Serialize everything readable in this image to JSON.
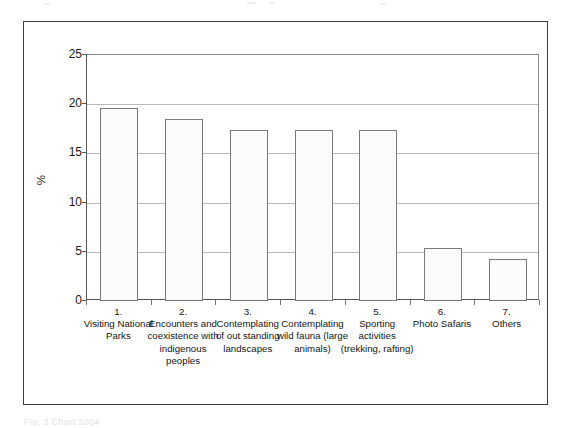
{
  "figure": {
    "caption_ghost": "Fig. 3      Chart  2004",
    "y_axis_title": "%"
  },
  "chart_data": {
    "type": "bar",
    "title": "",
    "subtitle": "",
    "xlabel": "",
    "ylabel": "%",
    "ylim": [
      0,
      25
    ],
    "yticks": [
      0,
      5,
      10,
      15,
      20,
      25
    ],
    "ytick_labels": [
      "0",
      "5",
      "10",
      "15",
      "20",
      "25"
    ],
    "grid": true,
    "grid_axis": "y",
    "legend": false,
    "legend_position": "none",
    "bar_fill_color": "#fbfbfb",
    "bar_edge_color": "#7a7a7a",
    "categories": [
      "1.\nVisiting National Parks",
      "2.\nEncounters and coexistence with indigenous peoples",
      "3.\nContemplating of out standing landscapes",
      "4.\nContemplating wild fauna (large animals)",
      "5.\nSporting activities (trekking, rafting)",
      "6.\nPhoto Safaris",
      "7.\nOthers"
    ],
    "category_numbers": [
      "1.",
      "2.",
      "3.",
      "4.",
      "5.",
      "6.",
      "7."
    ],
    "category_names": [
      "Visiting National Parks",
      "Encounters and coexistence with indigenous peoples",
      "Contemplating of out standing landscapes",
      "Contemplating wild fauna (large animals)",
      "Sporting activities (trekking, rafting)",
      "Photo Safaris",
      "Others"
    ],
    "values": [
      19.6,
      18.5,
      17.4,
      17.4,
      17.4,
      5.4,
      4.3
    ]
  }
}
